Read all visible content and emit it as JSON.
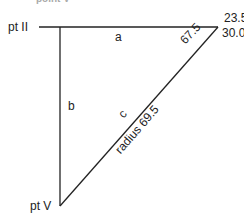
{
  "diagram": {
    "top_cut_text": "point V",
    "points": {
      "pt_ii": "pt II",
      "pt_v": "pt V",
      "coord_lat": "23.5 N",
      "coord_lon": "30.00 E"
    },
    "sides": {
      "a": "a",
      "b": "b",
      "c": "c"
    },
    "angle_label": "67.5",
    "radius_label": "radius 69.5",
    "line_color": "#222222"
  }
}
